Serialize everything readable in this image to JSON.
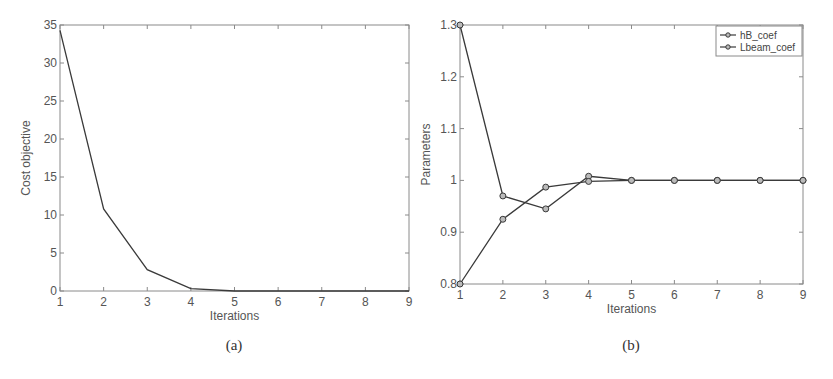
{
  "chart_data": [
    {
      "type": "line",
      "panel": "a",
      "caption": "(a)",
      "title": "",
      "xlabel": "Iterations",
      "ylabel": "Cost objective",
      "x": [
        1,
        2,
        3,
        4,
        5,
        6,
        7,
        8,
        9
      ],
      "series": [
        {
          "name": "Cost objective",
          "values": [
            34.3,
            10.8,
            2.8,
            0.3,
            0.0,
            0.0,
            0.0,
            0.0,
            0.0
          ],
          "markers": false
        }
      ],
      "xlim": [
        1,
        9
      ],
      "ylim": [
        0,
        35
      ],
      "xticks": [
        "1",
        "2",
        "3",
        "4",
        "5",
        "6",
        "7",
        "8",
        "9"
      ],
      "yticks": [
        "0",
        "5",
        "10",
        "15",
        "20",
        "25",
        "30",
        "35"
      ],
      "grid": false,
      "legend": null
    },
    {
      "type": "line",
      "panel": "b",
      "caption": "(b)",
      "title": "",
      "xlabel": "Iterations",
      "ylabel": "Parameters",
      "x": [
        1,
        2,
        3,
        4,
        5,
        6,
        7,
        8,
        9
      ],
      "series": [
        {
          "name": "hB_coef",
          "values": [
            1.3,
            0.97,
            0.945,
            1.008,
            1.0,
            1.0,
            1.0,
            1.0,
            1.0
          ],
          "markers": true
        },
        {
          "name": "Lbeam_coef",
          "values": [
            0.8,
            0.925,
            0.987,
            0.998,
            1.0,
            1.0,
            1.0,
            1.0,
            1.0
          ],
          "markers": true
        }
      ],
      "xlim": [
        1,
        9
      ],
      "ylim": [
        0.8,
        1.3
      ],
      "xticks": [
        "1",
        "2",
        "3",
        "4",
        "5",
        "6",
        "7",
        "8",
        "9"
      ],
      "yticks": [
        "0.8",
        "0.9",
        "1",
        "1.1",
        "1.2",
        "1.3"
      ],
      "grid": false,
      "legend": {
        "position": "top-right",
        "entries": [
          "hB_coef",
          "Lbeam_coef"
        ]
      }
    }
  ],
  "colors": {
    "line": "#3a3a3a",
    "axis": "#8a8a8a",
    "text": "#555555"
  }
}
